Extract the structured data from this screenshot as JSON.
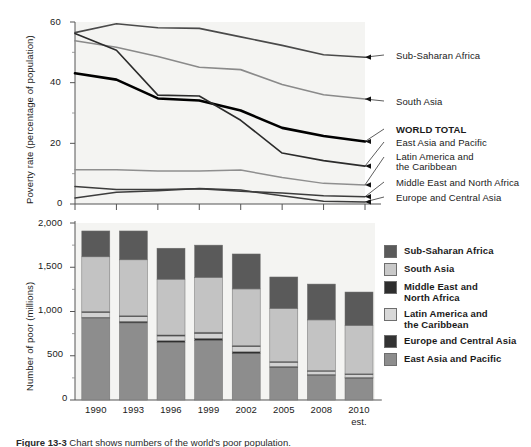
{
  "figure": {
    "caption_label": "Figure 13-3",
    "caption_text": "Chart shows numbers of the world's poor population."
  },
  "chart_data": [
    {
      "type": "line",
      "title": "",
      "xlabel": "",
      "ylabel": "Poverty rate (percentage of population)",
      "ylim": [
        0,
        60
      ],
      "yticks": [
        0,
        20,
        40,
        60
      ],
      "yticklabels": [
        "0",
        "20",
        "40",
        "60"
      ],
      "minor_yticks": [
        10,
        30,
        50
      ],
      "x": [
        "1990",
        "1993",
        "1996",
        "1999",
        "2002",
        "2005",
        "2008",
        "2010"
      ],
      "grid": false,
      "legend_position": "right-inline-labels",
      "series": [
        {
          "name": "Sub-Saharan Africa",
          "color": "#4a4a4a",
          "width": 1.6,
          "bold": false,
          "values": [
            56.5,
            59.4,
            58.1,
            57.9,
            55.1,
            52.3,
            49.2,
            48.4
          ]
        },
        {
          "name": "South Asia",
          "color": "#8a8a8a",
          "width": 1.6,
          "bold": false,
          "values": [
            53.8,
            51.7,
            48.6,
            45.1,
            44.3,
            39.4,
            36.0,
            34.6
          ]
        },
        {
          "name": "WORLD TOTAL",
          "color": "#000000",
          "width": 2.6,
          "bold": true,
          "values": [
            43.1,
            41.0,
            34.8,
            34.1,
            30.8,
            25.1,
            22.4,
            20.6
          ]
        },
        {
          "name": "East Asia and Pacific",
          "color": "#2b2b2b",
          "width": 1.6,
          "bold": false,
          "values": [
            56.2,
            50.7,
            35.9,
            35.6,
            27.6,
            16.8,
            14.3,
            12.5
          ]
        },
        {
          "name": "Latin America and the Caribbean",
          "color": "#8f8f8f",
          "width": 1.5,
          "bold": false,
          "values": [
            11.3,
            11.3,
            10.9,
            10.9,
            11.2,
            8.7,
            6.8,
            6.3
          ]
        },
        {
          "name": "Middle East and North Africa",
          "color": "#3c3c3c",
          "width": 1.5,
          "bold": false,
          "values": [
            5.8,
            4.8,
            4.8,
            5.0,
            4.2,
            3.6,
            2.7,
            2.4
          ]
        },
        {
          "name": "Europe and Central Asia",
          "color": "#3c3c3c",
          "width": 1.5,
          "bold": false,
          "values": [
            2.0,
            3.9,
            4.4,
            5.1,
            4.6,
            2.7,
            0.9,
            0.7
          ]
        }
      ]
    },
    {
      "type": "bar",
      "subtype": "stacked",
      "title": "",
      "xlabel": "",
      "ylabel": "Number of poor (millions)",
      "ylim": [
        0,
        2000
      ],
      "yticks": [
        0,
        500,
        1000,
        1500,
        2000
      ],
      "yticklabels": [
        "0",
        "500",
        "1,000",
        "1,500",
        "2,000"
      ],
      "minor_yticks": [
        250,
        750,
        1250,
        1750
      ],
      "categories": [
        "1990",
        "1993",
        "1996",
        "1999",
        "2002",
        "2005",
        "2008",
        "2010"
      ],
      "category_sublabels": [
        "",
        "",
        "",
        "",
        "",
        "",
        "",
        "est."
      ],
      "totals": [
        1910,
        1910,
        1715,
        1750,
        1650,
        1390,
        1310,
        1220
      ],
      "grid": false,
      "legend_position": "right",
      "stack_order_bottom_to_top": [
        "East Asia and Pacific",
        "Europe and Central Asia",
        "Latin America and the Caribbean",
        "Middle East and North Africa",
        "South Asia",
        "Sub-Saharan Africa"
      ],
      "series": [
        {
          "name": "East Asia and Pacific",
          "color": "#8d8d8d",
          "values": [
            926,
            871,
            650,
            673,
            523,
            366,
            284,
            251
          ]
        },
        {
          "name": "Europe and Central Asia",
          "color": "#2e2e2e",
          "values": [
            9,
            18,
            21,
            24,
            22,
            13,
            4,
            3
          ]
        },
        {
          "name": "Latin America and the Caribbean",
          "color": "#d2d2d2",
          "values": [
            53,
            52,
            52,
            55,
            58,
            46,
            37,
            34
          ]
        },
        {
          "name": "Middle East and North Africa",
          "color": "#2e2e2e",
          "values": [
            13,
            11,
            12,
            14,
            12,
            11,
            9,
            8
          ]
        },
        {
          "name": "South Asia",
          "color": "#c3c3c3",
          "values": [
            617,
            632,
            630,
            619,
            640,
            598,
            571,
            546
          ]
        },
        {
          "name": "Sub-Saharan Africa",
          "color": "#5a5a5a",
          "values": [
            292,
            326,
            350,
            365,
            395,
            356,
            405,
            378
          ]
        }
      ]
    }
  ],
  "line_labels": [
    {
      "text": "Sub-Saharan Africa",
      "bold": false
    },
    {
      "text": "South Asia",
      "bold": false
    },
    {
      "text": "WORLD TOTAL",
      "bold": true
    },
    {
      "text": "East Asia and Pacific",
      "bold": false
    },
    {
      "text": "Latin America and",
      "bold": false
    },
    {
      "text": "the Caribbean",
      "bold": false
    },
    {
      "text": "Middle East and North Africa",
      "bold": false
    },
    {
      "text": "Europe and Central Asia",
      "bold": false
    }
  ],
  "legend": {
    "items": [
      {
        "label_line1": "Sub-Saharan Africa",
        "label_line2": "",
        "color": "#5a5a5a"
      },
      {
        "label_line1": "South Asia",
        "label_line2": "",
        "color": "#c9c9c9"
      },
      {
        "label_line1": "Middle East and",
        "label_line2": "North Africa",
        "color": "#2e2e2e"
      },
      {
        "label_line1": "Latin America and",
        "label_line2": "the Caribbean",
        "color": "#d8d8d8"
      },
      {
        "label_line1": "Europe and Central Asia",
        "label_line2": "",
        "color": "#333333"
      },
      {
        "label_line1": "East Asia and Pacific",
        "label_line2": "",
        "color": "#8d8d8d"
      }
    ]
  },
  "axes": {
    "line": {
      "ylabel": "Poverty rate (percentage of population)",
      "yticklabels": [
        "60",
        "40",
        "20",
        "0"
      ]
    },
    "bar": {
      "ylabel": "Number of poor (millions)",
      "yticklabels": [
        "2,000",
        "1,500",
        "1,000",
        "500",
        "0"
      ],
      "xticklabels": [
        "1990",
        "1993",
        "1996",
        "1999",
        "2002",
        "2005",
        "2008",
        "2010"
      ],
      "last_sublabel": "est."
    }
  }
}
